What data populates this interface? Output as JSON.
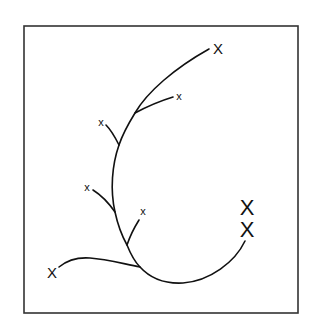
{
  "diagram": {
    "type": "branching-curve",
    "frame": {
      "x": 24,
      "y": 26,
      "width": 274,
      "height": 287
    },
    "marks": [
      {
        "id": "top-tip",
        "label": "X",
        "x": 218,
        "y": 48,
        "size": "medium"
      },
      {
        "id": "upper-right-branch",
        "label": "x",
        "x": 179,
        "y": 96,
        "size": "small"
      },
      {
        "id": "upper-left-branch",
        "label": "x",
        "x": 101,
        "y": 122,
        "size": "small"
      },
      {
        "id": "mid-left-branch",
        "label": "x",
        "x": 87,
        "y": 187,
        "size": "small"
      },
      {
        "id": "mid-right-branch",
        "label": "x",
        "x": 143,
        "y": 211,
        "size": "small"
      },
      {
        "id": "bottom-left-tip",
        "label": "X",
        "x": 52,
        "y": 272,
        "size": "medium"
      },
      {
        "id": "right-tip-upper",
        "label": "X",
        "x": 247,
        "y": 207,
        "size": "large"
      },
      {
        "id": "right-tip-lower",
        "label": "X",
        "x": 247,
        "y": 229,
        "size": "large"
      }
    ]
  }
}
